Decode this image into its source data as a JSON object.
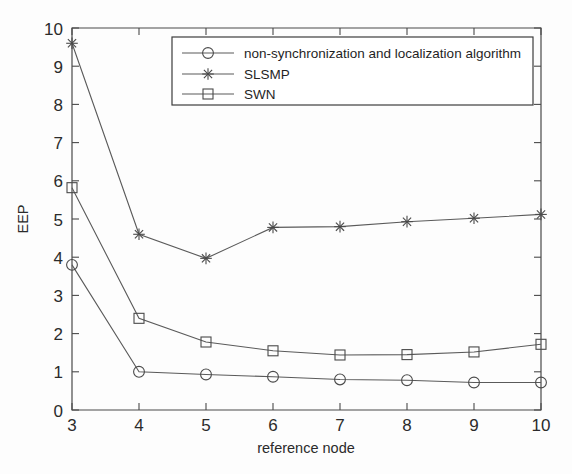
{
  "chart_data": {
    "type": "line",
    "title": "",
    "xlabel": "reference node",
    "ylabel": "EEP",
    "xlim": [
      3,
      10
    ],
    "ylim": [
      0,
      10
    ],
    "xticks": [
      3,
      4,
      5,
      6,
      7,
      8,
      9,
      10
    ],
    "yticks": [
      0,
      1,
      2,
      3,
      4,
      5,
      6,
      7,
      8,
      9,
      10
    ],
    "xtick_labels": [
      "3",
      "4",
      "5",
      "6",
      "7",
      "8",
      "9",
      "10"
    ],
    "ytick_labels": [
      "0",
      "1",
      "2",
      "3",
      "4",
      "5",
      "6",
      "7",
      "8",
      "9",
      "10"
    ],
    "grid": false,
    "legend_position": "upper right",
    "x": [
      3,
      4,
      5,
      6,
      7,
      8,
      9,
      10
    ],
    "series": [
      {
        "name": "non-synchronization and localization algorithm",
        "marker": "circle",
        "values": [
          3.8,
          1.0,
          0.93,
          0.87,
          0.8,
          0.78,
          0.72,
          0.72
        ]
      },
      {
        "name": "SLSMP",
        "marker": "star",
        "values": [
          9.6,
          4.6,
          3.97,
          4.78,
          4.8,
          4.93,
          5.02,
          5.12
        ]
      },
      {
        "name": "SWN",
        "marker": "square",
        "values": [
          5.82,
          2.4,
          1.78,
          1.55,
          1.44,
          1.45,
          1.52,
          1.72
        ]
      }
    ],
    "colors": {
      "line": "#5a5a5a",
      "axis": "#4a4a4a",
      "text": "#2b2b2b",
      "background": "#fdfdfd"
    }
  },
  "legend": {
    "entries": [
      {
        "label": "non-synchronization and localization algorithm",
        "marker": "circle-marker"
      },
      {
        "label": "SLSMP",
        "marker": "star-marker"
      },
      {
        "label": "SWN",
        "marker": "square-marker"
      }
    ]
  },
  "axes": {
    "y_title": "EEP",
    "x_title": "reference node"
  }
}
